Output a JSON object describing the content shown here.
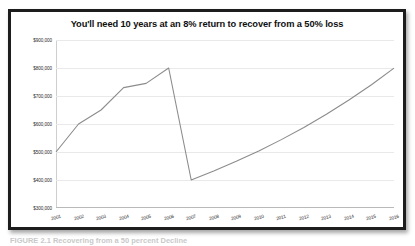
{
  "chart_data": {
    "type": "line",
    "title": "You'll need 10 years at an 8% return to recover from a 50% loss",
    "xlabel": "",
    "ylabel": "",
    "grid": true,
    "legend_position": "none",
    "line_color": "#8c8c8c",
    "ylim": [
      300000,
      900000
    ],
    "ytick_labels": [
      "$900,000",
      "$800,000",
      "$700,000",
      "$600,000",
      "$500,000",
      "$400,000",
      "$300,000"
    ],
    "ytick_values": [
      900000,
      800000,
      700000,
      600000,
      500000,
      400000,
      300000
    ],
    "categories": [
      "2001",
      "2002",
      "2003",
      "2004",
      "2005",
      "2006",
      "2007",
      "2008",
      "2009",
      "2010",
      "2011",
      "2012",
      "2013",
      "2014",
      "2015",
      "2016"
    ],
    "series": [
      {
        "name": "Portfolio value",
        "values": [
          500000,
          600000,
          650000,
          730000,
          745000,
          800000,
          400000,
          432000,
          466560,
          503885,
          544196,
          587732,
          634751,
          685531,
          740373,
          799603
        ]
      }
    ]
  },
  "caption": {
    "text": "FIGURE 2.1   Recovering from a 50 percent Decline"
  }
}
